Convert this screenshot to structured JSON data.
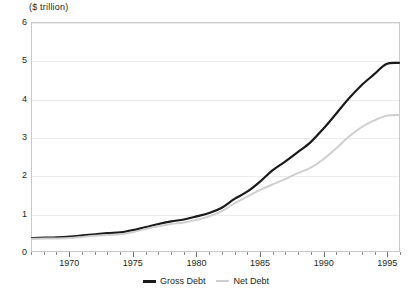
{
  "chart_data": {
    "type": "line",
    "title": "($ trillion)",
    "xlabel": "",
    "ylabel": "",
    "ylim": [
      0,
      6
    ],
    "xlim": [
      1967,
      1996
    ],
    "grid": true,
    "legend_position": "bottom-center",
    "ytick_labels": [
      "6",
      "5",
      "4",
      "3",
      "2",
      "1",
      "0"
    ],
    "ytick_values": [
      6,
      5,
      4,
      3,
      2,
      1,
      0
    ],
    "xtick_labels": [
      "1970",
      "1975",
      "1980",
      "1985",
      "1990",
      "1995"
    ],
    "xtick_values": [
      1970,
      1975,
      1980,
      1985,
      1990,
      1995
    ],
    "x": [
      1967,
      1968,
      1969,
      1970,
      1971,
      1972,
      1973,
      1974,
      1975,
      1976,
      1977,
      1978,
      1979,
      1980,
      1981,
      1982,
      1983,
      1984,
      1985,
      1986,
      1987,
      1988,
      1989,
      1990,
      1991,
      1992,
      1993,
      1994,
      1995,
      1996
    ],
    "series": [
      {
        "name": "Gross Debt",
        "color": "#1a1a1a",
        "values": [
          0.34,
          0.35,
          0.36,
          0.38,
          0.41,
          0.44,
          0.47,
          0.49,
          0.55,
          0.63,
          0.71,
          0.78,
          0.83,
          0.91,
          1.0,
          1.14,
          1.37,
          1.56,
          1.82,
          2.12,
          2.35,
          2.6,
          2.86,
          3.21,
          3.6,
          4.0,
          4.35,
          4.64,
          4.92,
          4.95
        ]
      },
      {
        "name": "Net Debt",
        "color": "#cfcfcf",
        "values": [
          0.32,
          0.33,
          0.33,
          0.34,
          0.37,
          0.4,
          0.42,
          0.44,
          0.5,
          0.58,
          0.65,
          0.71,
          0.75,
          0.82,
          0.91,
          1.05,
          1.25,
          1.43,
          1.6,
          1.75,
          1.89,
          2.05,
          2.19,
          2.41,
          2.69,
          3.0,
          3.25,
          3.43,
          3.56,
          3.58
        ]
      }
    ]
  },
  "legend": {
    "entries": [
      {
        "label": "Gross Debt"
      },
      {
        "label": "Net Debt"
      }
    ]
  }
}
